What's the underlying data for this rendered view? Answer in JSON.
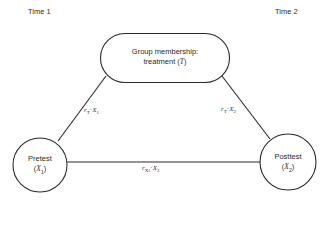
{
  "diagram": {
    "time_labels": {
      "left": "Time 1",
      "right": "Time 2"
    },
    "nodes": {
      "treatment": {
        "shape": "rounded-rectangle",
        "line1": "Group membership:",
        "line2_prefix": "treatment (",
        "line2_symbol": "T",
        "line2_suffix": ")"
      },
      "pretest": {
        "shape": "circle",
        "line1": "Pretest",
        "symbol_open": "(",
        "symbol": "X",
        "symbol_sub": "1",
        "symbol_close": ")"
      },
      "posttest": {
        "shape": "circle",
        "line1": "Posttest",
        "symbol_open": "(",
        "symbol": "X",
        "symbol_sub": "2",
        "symbol_close": ")"
      }
    },
    "edges": {
      "treatment_pretest": {
        "from": "treatment",
        "to": "pretest",
        "label_r": "r",
        "label_r_sub": "T",
        "label_sep": "·",
        "label_var": "X",
        "label_var_sub": "1"
      },
      "treatment_posttest": {
        "from": "treatment",
        "to": "posttest",
        "label_r": "r",
        "label_r_sub": "T",
        "label_sep": "·",
        "label_var": "X",
        "label_var_sub": "2"
      },
      "pretest_posttest": {
        "from": "pretest",
        "to": "posttest",
        "label_r": "r",
        "label_r_sub1": "X",
        "label_r_sub1_sub": "1",
        "label_sep": "·",
        "label_var": "X",
        "label_var_sub": "2"
      }
    },
    "colors": {
      "stroke": "#2a2a2a",
      "background": "#ffffff"
    }
  }
}
